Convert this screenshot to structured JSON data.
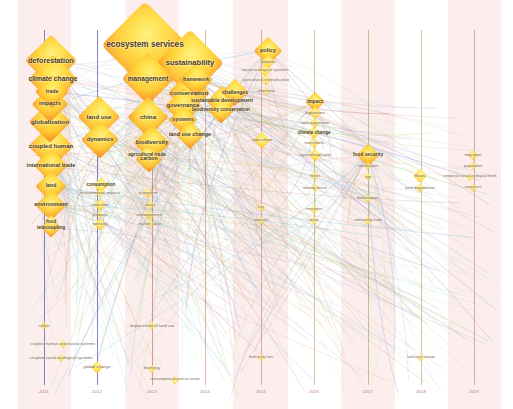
{
  "view": {
    "title": "Term co-occurrence timeline overlay map",
    "width": 513,
    "height": 409,
    "background": "#ffffff",
    "band_color_a": "#fbeeec",
    "band_color_b": "#ffffff",
    "label_color": "#4a3a14",
    "node_fill_center": "#ffe24a",
    "node_fill_edge": "#f08a22",
    "axis_label_color": "#c2756b"
  },
  "axis": {
    "label": "",
    "ticks": [
      {
        "x": 44,
        "label": "2011"
      },
      {
        "x": 97,
        "label": "2012"
      },
      {
        "x": 152,
        "label": "2013"
      },
      {
        "x": 205,
        "label": "2014"
      },
      {
        "x": 261,
        "label": "2015"
      },
      {
        "x": 314,
        "label": "2016"
      },
      {
        "x": 368,
        "label": "2017"
      },
      {
        "x": 421,
        "label": "2018"
      },
      {
        "x": 474,
        "label": "2019"
      }
    ]
  },
  "columns": [
    {
      "x": 44,
      "color": "#5a5ab4"
    },
    {
      "x": 97,
      "color": "#5a5ab4"
    },
    {
      "x": 152,
      "color": "#b05a4a"
    },
    {
      "x": 205,
      "color": "#d07a5a"
    },
    {
      "x": 261,
      "color": "#c2706a"
    },
    {
      "x": 314,
      "color": "#b09a4a"
    },
    {
      "x": 368,
      "color": "#8a9a4a"
    },
    {
      "x": 421,
      "color": "#9aa84a"
    },
    {
      "x": 474,
      "color": "#c06a7a"
    }
  ],
  "chart_data": {
    "type": "scatter",
    "xlabel": "",
    "ylabel": "",
    "xlim": [
      2011,
      2019
    ],
    "grid": true,
    "legend": "none",
    "nodes": [
      {
        "label": "ecosystem services",
        "x": 145,
        "y": 45,
        "size": 86,
        "font": 8.2
      },
      {
        "label": "sustainability",
        "x": 190,
        "y": 63,
        "size": 66,
        "font": 7.6
      },
      {
        "label": "deforestation",
        "x": 51,
        "y": 61,
        "size": 52,
        "font": 7.2
      },
      {
        "label": "management",
        "x": 148,
        "y": 79,
        "size": 52,
        "font": 6.6
      },
      {
        "label": "climate change",
        "x": 53,
        "y": 79,
        "size": 48,
        "font": 6.8
      },
      {
        "label": "framework",
        "x": 196,
        "y": 80,
        "size": 34,
        "font": 5.2
      },
      {
        "label": "conservation",
        "x": 189,
        "y": 93,
        "size": 42,
        "font": 6.2
      },
      {
        "label": "trade",
        "x": 52,
        "y": 92,
        "size": 34,
        "font": 5.2
      },
      {
        "label": "challenges",
        "x": 235,
        "y": 92,
        "size": 26,
        "font": 5.0
      },
      {
        "label": "sustainable development",
        "x": 222,
        "y": 101,
        "size": 30,
        "font": 5.2
      },
      {
        "label": "governance",
        "x": 183,
        "y": 106,
        "size": 36,
        "font": 5.8
      },
      {
        "label": "biodiversity conservation",
        "x": 221,
        "y": 110,
        "size": 26,
        "font": 4.8
      },
      {
        "label": "impacts",
        "x": 50,
        "y": 104,
        "size": 36,
        "font": 5.8
      },
      {
        "label": "globalization",
        "x": 50,
        "y": 122,
        "size": 42,
        "font": 6.2
      },
      {
        "label": "land use",
        "x": 99,
        "y": 117,
        "size": 42,
        "font": 6.2
      },
      {
        "label": "china",
        "x": 148,
        "y": 117,
        "size": 40,
        "font": 6.2
      },
      {
        "label": "systems",
        "x": 183,
        "y": 120,
        "size": 28,
        "font": 5.4
      },
      {
        "label": "policy",
        "x": 268,
        "y": 51,
        "size": 28,
        "font": 5.6
      },
      {
        "label": "footprint",
        "x": 268,
        "y": 62,
        "size": 14,
        "font": 4.2
      },
      {
        "label": "social-ecological systems",
        "x": 265,
        "y": 70,
        "size": 12,
        "font": 4.2
      },
      {
        "label": "agricultural intensification",
        "x": 266,
        "y": 80,
        "size": 11,
        "font": 4.2
      },
      {
        "label": "urbanization",
        "x": 266,
        "y": 92,
        "size": 9,
        "font": 3.4
      },
      {
        "label": "impact",
        "x": 315,
        "y": 102,
        "size": 20,
        "font": 4.8
      },
      {
        "label": "expansion",
        "x": 315,
        "y": 113,
        "size": 13,
        "font": 4.4
      },
      {
        "label": "coupled human",
        "x": 51,
        "y": 146,
        "size": 44,
        "font": 6.0
      },
      {
        "label": "dynamics",
        "x": 100,
        "y": 140,
        "size": 38,
        "font": 5.8
      },
      {
        "label": "biodiversity",
        "x": 152,
        "y": 143,
        "size": 36,
        "font": 5.8
      },
      {
        "label": "land use change",
        "x": 190,
        "y": 135,
        "size": 28,
        "font": 5.4
      },
      {
        "label": "land acquisition",
        "x": 315,
        "y": 123,
        "size": 11,
        "font": 4.2
      },
      {
        "label": "climate change",
        "x": 314,
        "y": 133,
        "size": 13,
        "font": 4.6
      },
      {
        "label": "carbon",
        "x": 149,
        "y": 159,
        "size": 26,
        "font": 5.2
      },
      {
        "label": "agricultural trade",
        "x": 147,
        "y": 155,
        "size": 16,
        "font": 4.6
      },
      {
        "label": "international trade",
        "x": 51,
        "y": 166,
        "size": 34,
        "font": 5.6
      },
      {
        "label": "agriculture",
        "x": 262,
        "y": 140,
        "size": 16,
        "font": 4.4
      },
      {
        "label": "transitions",
        "x": 314,
        "y": 143,
        "size": 11,
        "font": 4.2
      },
      {
        "label": "food security",
        "x": 368,
        "y": 155,
        "size": 22,
        "font": 4.8
      },
      {
        "label": "migration",
        "x": 473,
        "y": 155,
        "size": 11,
        "font": 4.2
      },
      {
        "label": "land",
        "x": 51,
        "y": 186,
        "size": 30,
        "font": 5.2
      },
      {
        "label": "consumption",
        "x": 101,
        "y": 185,
        "size": 15,
        "font": 4.6
      },
      {
        "label": "agricultural land",
        "x": 315,
        "y": 155,
        "size": 12,
        "font": 4.4
      },
      {
        "label": "certification",
        "x": 368,
        "y": 166,
        "size": 9,
        "font": 4.0
      },
      {
        "label": "population",
        "x": 473,
        "y": 166,
        "size": 9,
        "font": 4.0
      },
      {
        "label": "environmental impacts",
        "x": 100,
        "y": 193,
        "size": 10,
        "font": 4.0
      },
      {
        "label": "ecosystem",
        "x": 148,
        "y": 193,
        "size": 11,
        "font": 4.0
      },
      {
        "label": "flows",
        "x": 420,
        "y": 176,
        "size": 14,
        "font": 4.4
      },
      {
        "label": "temperate social-ecological fields",
        "x": 470,
        "y": 177,
        "size": 8,
        "font": 3.6
      },
      {
        "label": "forest",
        "x": 315,
        "y": 176,
        "size": 9,
        "font": 4.0
      },
      {
        "label": "soy",
        "x": 368,
        "y": 177,
        "size": 9,
        "font": 4.0
      },
      {
        "label": "environment",
        "x": 51,
        "y": 205,
        "size": 30,
        "font": 5.6
      },
      {
        "label": "evolution",
        "x": 100,
        "y": 205,
        "size": 13,
        "font": 4.4
      },
      {
        "label": "areas",
        "x": 150,
        "y": 205,
        "size": 10,
        "font": 4.0
      },
      {
        "label": "land degradation",
        "x": 420,
        "y": 188,
        "size": 10,
        "font": 4.0
      },
      {
        "label": "atlantic forest",
        "x": 315,
        "y": 188,
        "size": 9,
        "font": 4.0
      },
      {
        "label": "resources",
        "x": 473,
        "y": 188,
        "size": 9,
        "font": 3.8
      },
      {
        "label": "products",
        "x": 100,
        "y": 215,
        "size": 9,
        "font": 4.0
      },
      {
        "label": "management",
        "x": 149,
        "y": 215,
        "size": 11,
        "font": 4.4
      },
      {
        "label": "city",
        "x": 261,
        "y": 208,
        "size": 9,
        "font": 3.8
      },
      {
        "label": "emissions",
        "x": 314,
        "y": 210,
        "size": 9,
        "font": 3.8
      },
      {
        "label": "deforestation",
        "x": 368,
        "y": 199,
        "size": 9,
        "font": 3.8
      },
      {
        "label": "telecoupling",
        "x": 51,
        "y": 228,
        "size": 20,
        "font": 4.8
      },
      {
        "label": "food",
        "x": 51,
        "y": 222,
        "size": 14,
        "font": 4.6
      },
      {
        "label": "forestry",
        "x": 100,
        "y": 224,
        "size": 12,
        "font": 4.4
      },
      {
        "label": "market value",
        "x": 150,
        "y": 224,
        "size": 9,
        "font": 4.0
      },
      {
        "label": "impacts",
        "x": 261,
        "y": 221,
        "size": 9,
        "font": 3.8
      },
      {
        "label": "return",
        "x": 314,
        "y": 221,
        "size": 9,
        "font": 3.8
      },
      {
        "label": "commodity trade",
        "x": 368,
        "y": 221,
        "size": 9,
        "font": 3.8
      },
      {
        "label": "global change",
        "x": 97,
        "y": 367,
        "size": 12,
        "font": 4.4
      },
      {
        "label": "displacement of land use",
        "x": 152,
        "y": 326,
        "size": 9,
        "font": 4.0
      },
      {
        "label": "coffee",
        "x": 44,
        "y": 326,
        "size": 9,
        "font": 4.0
      },
      {
        "label": "coupled human and natural systems",
        "x": 63,
        "y": 344,
        "size": 8,
        "font": 4.0
      },
      {
        "label": "coupled social-ecological systems",
        "x": 61,
        "y": 358,
        "size": 8,
        "font": 4.2
      },
      {
        "label": "consumption-based accounts",
        "x": 175,
        "y": 380,
        "size": 8,
        "font": 3.8
      },
      {
        "label": "bioenergy",
        "x": 152,
        "y": 369,
        "size": 8,
        "font": 3.8
      },
      {
        "label": "biodiversity loss",
        "x": 261,
        "y": 358,
        "size": 7,
        "font": 3.4
      },
      {
        "label": "land cover change",
        "x": 421,
        "y": 358,
        "size": 7,
        "font": 3.4
      }
    ]
  },
  "terms": {
    "large": [
      "ecosystem services",
      "sustainability",
      "deforestation",
      "management",
      "climate change",
      "conservation",
      "governance",
      "globalization",
      "land use",
      "china",
      "coupled human",
      "dynamics",
      "biodiversity",
      "international trade",
      "land",
      "environment",
      "impacts",
      "trade",
      "framework",
      "systems",
      "land use change",
      "carbon",
      "telecoupling",
      "policy",
      "food security"
    ],
    "medium": [
      "challenges",
      "sustainable development",
      "biodiversity conservation",
      "agricultural trade",
      "consumption",
      "footprint",
      "social-ecological systems",
      "agricultural intensification",
      "impact",
      "expansion",
      "land acquisition",
      "transitions",
      "agriculture",
      "agricultural land",
      "flows",
      "migration",
      "land degradation",
      "evolution",
      "forestry",
      "ecosystem",
      "food"
    ],
    "small": [
      "urbanization",
      "certification",
      "population",
      "forest",
      "soy",
      "atlantic forest",
      "resources",
      "products",
      "areas",
      "city",
      "emissions",
      "deforestation",
      "return",
      "commodity trade",
      "market value",
      "environmental impacts",
      "global change",
      "displacement of land use",
      "coffee",
      "bioenergy",
      "coupled human and natural systems",
      "coupled social-ecological systems",
      "consumption-based accounts",
      "biodiversity loss",
      "land cover change",
      "temperate social-ecological fields",
      "impacts"
    ]
  }
}
